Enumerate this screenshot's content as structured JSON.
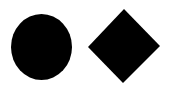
{
  "shapes": [
    {
      "kind": "ellipse",
      "label": "circle",
      "fill": "#000000"
    },
    {
      "kind": "diamond",
      "label": "diamond",
      "fill": "#000000"
    }
  ],
  "background": "#ffffff"
}
